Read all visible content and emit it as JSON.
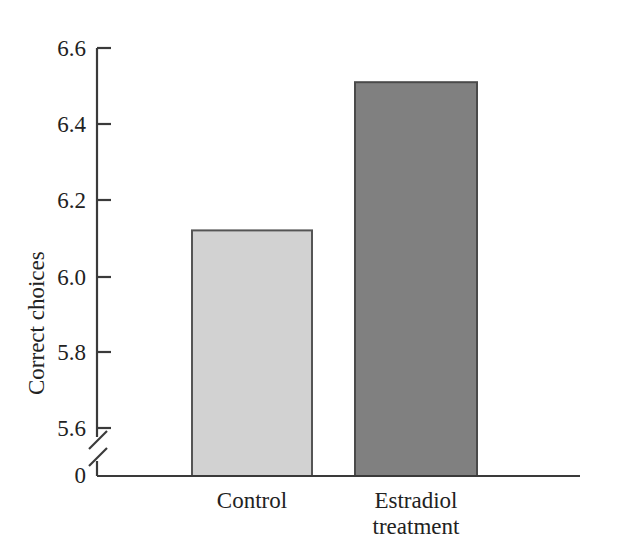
{
  "chart_data": {
    "type": "bar",
    "title": "",
    "subtitle": "",
    "xlabel": "",
    "ylabel": "Correct choices",
    "categories": [
      "Control",
      "Estradiol treatment"
    ],
    "category_lines": [
      [
        "Control"
      ],
      [
        "Estradiol",
        "treatment"
      ]
    ],
    "values": [
      6.12,
      6.51
    ],
    "value_labels": [
      "",
      ""
    ],
    "ylim": [
      5.6,
      6.6
    ],
    "yticks": [
      5.6,
      5.8,
      6.0,
      6.2,
      6.4,
      6.6
    ],
    "ytick_labels": [
      "5.6",
      "5.8",
      "6.0",
      "6.2",
      "6.4",
      "6.6"
    ],
    "baseline_label": "0",
    "axis_break": true,
    "axis_break_note": "double-slash break between 0 and 5.6 on the y-axis",
    "grid": false,
    "legend": false,
    "legend_position": "none",
    "bar_colors": [
      "#d2d2d2",
      "#808080"
    ],
    "bar_edge_color": "#4a4a4a",
    "axis_color": "#3a3a3a"
  },
  "axis": {
    "y_title": "Correct choices",
    "zero_label": "0",
    "ticks": [
      {
        "label": "6.6"
      },
      {
        "label": "6.4"
      },
      {
        "label": "6.2"
      },
      {
        "label": "6.0"
      },
      {
        "label": "5.8"
      },
      {
        "label": "5.6"
      }
    ]
  },
  "bars": [
    {
      "name": "control",
      "label_line1": "Control",
      "label_line2": ""
    },
    {
      "name": "estradiol-treatment",
      "label_line1": "Estradiol",
      "label_line2": "treatment"
    }
  ]
}
